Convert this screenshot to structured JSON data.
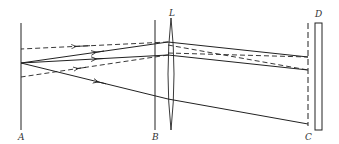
{
  "diagram": {
    "type": "optics ray diagram",
    "labels": {
      "A": "A",
      "B": "B",
      "L": "L",
      "C": "C",
      "D": "D"
    },
    "colors": {
      "line": "#222222",
      "background": "#ffffff"
    },
    "elements": [
      {
        "id": "A",
        "kind": "screen",
        "description": "vertical line at left"
      },
      {
        "id": "B",
        "kind": "plane",
        "description": "vertical line left of lens"
      },
      {
        "id": "L",
        "kind": "lens",
        "description": "biconvex lens"
      },
      {
        "id": "C",
        "kind": "dashed plane",
        "description": "dashed vertical line"
      },
      {
        "id": "D",
        "kind": "mirror",
        "description": "narrow rectangle at right"
      }
    ],
    "rays": [
      {
        "style": "dashed",
        "direction": "leftward",
        "arrow": true
      },
      {
        "style": "solid",
        "direction": "leftward",
        "arrow": true
      },
      {
        "style": "solid",
        "direction": "leftward",
        "arrow": true
      },
      {
        "style": "dashed",
        "direction": "leftward",
        "arrow": true
      },
      {
        "style": "solid",
        "direction": "leftward",
        "arrow": true
      }
    ]
  }
}
